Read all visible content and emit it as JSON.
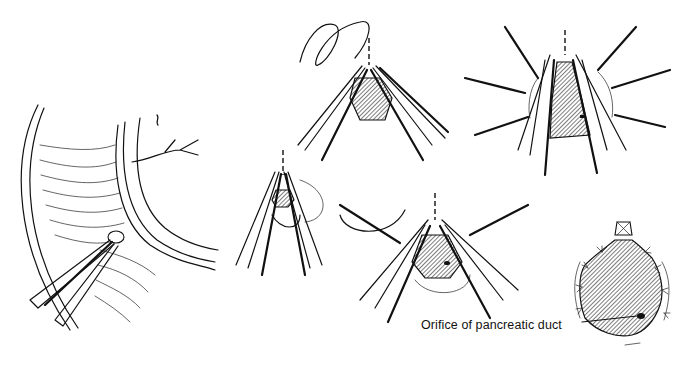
{
  "figure": {
    "panels": [
      {
        "id": "panel-1",
        "name": "duodenum-incision-with-forceps"
      },
      {
        "id": "panel-2",
        "name": "forceps-incision-small"
      },
      {
        "id": "panel-3",
        "name": "suture-placement"
      },
      {
        "id": "panel-4",
        "name": "forceps-extended-incision"
      },
      {
        "id": "panel-5",
        "name": "radiating-stay-sutures"
      },
      {
        "id": "panel-6",
        "name": "completed-sphincteroplasty"
      }
    ],
    "labels": {
      "pancreatic_duct": "Orifice of pancreatic duct"
    },
    "colors": {
      "ink": "#111111",
      "background": "#ffffff"
    }
  }
}
